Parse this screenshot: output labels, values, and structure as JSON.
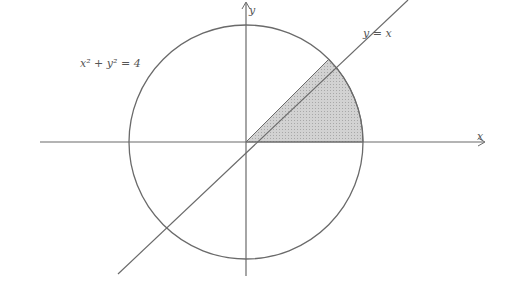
{
  "diagram": {
    "circle_label": "x² + y² = 4",
    "line_label": "y = x",
    "x_axis_label": "x",
    "y_axis_label": "y",
    "shaded_region": "sector between y=0 and y=x inside circle (first quadrant)",
    "colors": {
      "stroke": "#6a6a6a",
      "shade": "#c8c8c8",
      "background": "#ffffff"
    }
  }
}
